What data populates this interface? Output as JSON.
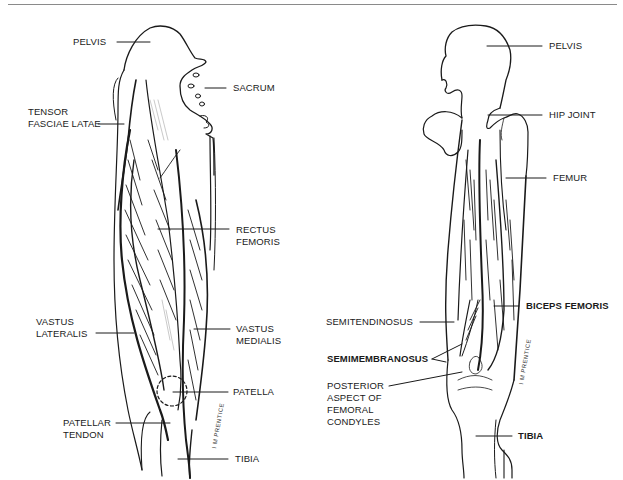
{
  "figure": {
    "type": "anatomical line illustration",
    "accent_color": "#1a1a1a",
    "rule_color": "#8a8a8a"
  },
  "anterior_view": {
    "labels": [
      {
        "id": "pelvis",
        "text": "PELVIS"
      },
      {
        "id": "sacrum",
        "text": "SACRUM"
      },
      {
        "id": "tensor",
        "text": "TENSOR\nFASCIAE LATAE"
      },
      {
        "id": "rectus",
        "text": "RECTUS\nFEMORIS"
      },
      {
        "id": "vastus_lateralis",
        "text": "VASTUS\nLATERALIS"
      },
      {
        "id": "vastus_medialis",
        "text": "VASTUS\nMEDIALIS"
      },
      {
        "id": "patella",
        "text": "PATELLA"
      },
      {
        "id": "patellar_tendon",
        "text": "PATELLAR\nTENDON"
      },
      {
        "id": "tibia",
        "text": "TIBIA"
      }
    ],
    "signature": "I M PRENTICE"
  },
  "posterior_view": {
    "labels": [
      {
        "id": "pelvis",
        "text": "PELVIS"
      },
      {
        "id": "hip_joint",
        "text": "HIP JOINT"
      },
      {
        "id": "femur",
        "text": "FEMUR"
      },
      {
        "id": "biceps_femoris",
        "text": "BICEPS FEMORIS"
      },
      {
        "id": "semitendinosus",
        "text": "SEMITENDINOSUS"
      },
      {
        "id": "semimembranosus",
        "text": "SEMIMEMBRANOSUS"
      },
      {
        "id": "posterior_aspect",
        "text": "POSTERIOR\nASPECT OF\nFEMORAL\nCONDYLES"
      },
      {
        "id": "tibia",
        "text": "TIBIA"
      }
    ],
    "signature": "I M PRENTICE"
  }
}
